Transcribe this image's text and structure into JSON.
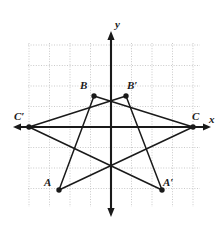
{
  "figure": {
    "background_color": "#ffffff",
    "grid_color": "#c9c9c9",
    "axis_color": "#1a1a1a",
    "stroke_color": "#1a1a1a",
    "point_color": "#1a1a1a"
  },
  "axes": {
    "x_label": "x",
    "y_label": "y",
    "origin_px": {
      "x": 111,
      "y": 127
    },
    "grid_spacing_px": 20.5,
    "x_axis_px": {
      "x1": 13,
      "x2": 211,
      "y": 127
    },
    "y_axis_px": {
      "y1": 31,
      "y2": 217,
      "x": 111
    },
    "grid_extent_px": {
      "left": 28,
      "right": 200,
      "top": 43,
      "bottom": 207
    }
  },
  "points": [
    {
      "name": "A",
      "label": "A",
      "px": {
        "x": 59,
        "y": 190
      },
      "label_px": {
        "x": 44,
        "y": 186
      }
    },
    {
      "name": "B",
      "label": "B",
      "px": {
        "x": 94,
        "y": 96
      },
      "label_px": {
        "x": 80,
        "y": 89
      }
    },
    {
      "name": "C",
      "label": "C",
      "px": {
        "x": 193,
        "y": 127
      },
      "label_px": {
        "x": 192,
        "y": 120
      }
    },
    {
      "name": "Ap",
      "label": "A′",
      "px": {
        "x": 162,
        "y": 190
      },
      "label_px": {
        "x": 163,
        "y": 186
      }
    },
    {
      "name": "Bp",
      "label": "B′",
      "px": {
        "x": 126,
        "y": 96
      },
      "label_px": {
        "x": 127,
        "y": 89
      }
    },
    {
      "name": "Cp",
      "label": "C′",
      "px": {
        "x": 29,
        "y": 127
      },
      "label_px": {
        "x": 14,
        "y": 120
      }
    }
  ],
  "segments": [
    {
      "name": "segment-AB",
      "from": "A",
      "to": "B"
    },
    {
      "name": "segment-BC",
      "from": "B",
      "to": "C"
    },
    {
      "name": "segment-CA",
      "from": "C",
      "to": "A"
    },
    {
      "name": "segment-ApBp",
      "from": "Ap",
      "to": "Bp"
    },
    {
      "name": "segment-BpCp",
      "from": "Bp",
      "to": "Cp"
    },
    {
      "name": "segment-CpAp",
      "from": "Cp",
      "to": "Ap"
    }
  ],
  "chart_data": {
    "type": "scatter",
    "xlabel": "x",
    "ylabel": "y",
    "grid": true,
    "xlim": [
      -4,
      4.5
    ],
    "ylim": [
      -4,
      4
    ],
    "series": [
      {
        "name": "Triangle ABC",
        "points": [
          {
            "label": "A",
            "x": -2.5,
            "y": -3
          },
          {
            "label": "B",
            "x": -0.8,
            "y": 1.5
          },
          {
            "label": "C",
            "x": 4,
            "y": 0
          }
        ]
      },
      {
        "name": "Triangle A′B′C′",
        "points": [
          {
            "label": "A′",
            "x": 2.5,
            "y": -3
          },
          {
            "label": "B′",
            "x": 0.8,
            "y": 1.5
          },
          {
            "label": "C′",
            "x": -4,
            "y": 0
          }
        ]
      }
    ]
  }
}
